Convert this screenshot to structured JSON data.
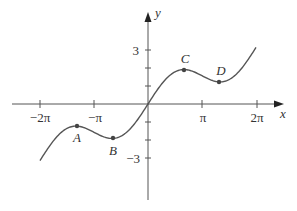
{
  "chart_data": {
    "type": "line",
    "title": "",
    "function": "y = x/2 + sin x",
    "xlabel": "x",
    "ylabel": "y",
    "x_range": [
      -6.283,
      6.283
    ],
    "x_ticks": [
      {
        "value": -6.283,
        "label": "−2π"
      },
      {
        "value": -3.1416,
        "label": "−π"
      },
      {
        "value": 3.1416,
        "label": "π"
      },
      {
        "value": 6.283,
        "label": "2π"
      }
    ],
    "y_ticks": [
      {
        "value": 3,
        "label": "3"
      },
      {
        "value": 2,
        "label": ""
      },
      {
        "value": 1,
        "label": ""
      },
      {
        "value": -1,
        "label": ""
      },
      {
        "value": -2,
        "label": ""
      },
      {
        "value": -3,
        "label": "−3"
      }
    ],
    "labeled_points": [
      {
        "name": "A",
        "x": -4.189,
        "y": -1.228
      },
      {
        "name": "B",
        "x": -2.094,
        "y": -1.913
      },
      {
        "name": "C",
        "x": 2.094,
        "y": 1.913
      },
      {
        "name": "D",
        "x": 4.189,
        "y": 1.228
      }
    ],
    "grid": false,
    "legend": null
  },
  "labels": {
    "x_axis": "x",
    "y_axis": "y",
    "tick_neg2pi": "−2π",
    "tick_negpi": "−π",
    "tick_pi": "π",
    "tick_2pi": "2π",
    "tick_3": "3",
    "tick_neg3": "−3",
    "point_A": "A",
    "point_B": "B",
    "point_C": "C",
    "point_D": "D"
  },
  "colors": {
    "axis": "#555555",
    "curve": "#555555",
    "text": "#333333"
  }
}
